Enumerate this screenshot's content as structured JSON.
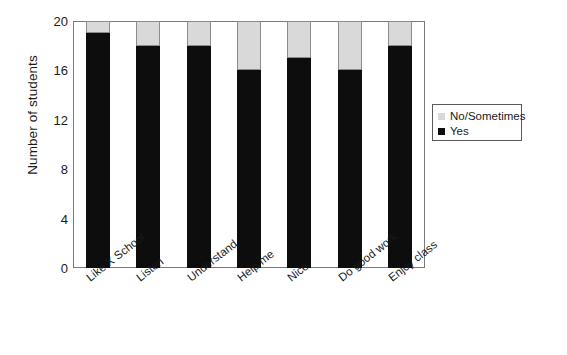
{
  "chart_data": {
    "type": "bar",
    "subtype": "stacked-bar",
    "title": "",
    "xlabel": "",
    "ylabel": "Number of students",
    "ylim": [
      0,
      20
    ],
    "yticks": [
      0,
      4,
      8,
      12,
      16,
      20
    ],
    "ytick_labels": [
      "0",
      "4",
      "8",
      "12",
      "16",
      "20"
    ],
    "grid": false,
    "categories": [
      "Like X School",
      "Listen",
      "Understand",
      "Help me",
      "Nice",
      "Do good work",
      "Enjoy class"
    ],
    "series": [
      {
        "name": "Yes",
        "color": "#0d0d0d",
        "values": [
          19,
          18,
          18,
          16,
          17,
          16,
          18
        ]
      },
      {
        "name": "No/Sometimes",
        "color": "#d9d9d9",
        "values": [
          1,
          2,
          2,
          4,
          3,
          4,
          2
        ]
      }
    ],
    "stack_totals": [
      20,
      20,
      20,
      20,
      20,
      20,
      20
    ],
    "legend": {
      "position": "right",
      "entries": [
        {
          "label": "No/Sometimes",
          "color": "#d9d9d9"
        },
        {
          "label": "Yes",
          "color": "#0d0d0d"
        }
      ]
    },
    "colors": {
      "yes": "#0d0d0d",
      "no_sometimes": "#d9d9d9",
      "axis": "#7a7a7a",
      "text": "#1a1a1a",
      "background": "#ffffff"
    }
  }
}
